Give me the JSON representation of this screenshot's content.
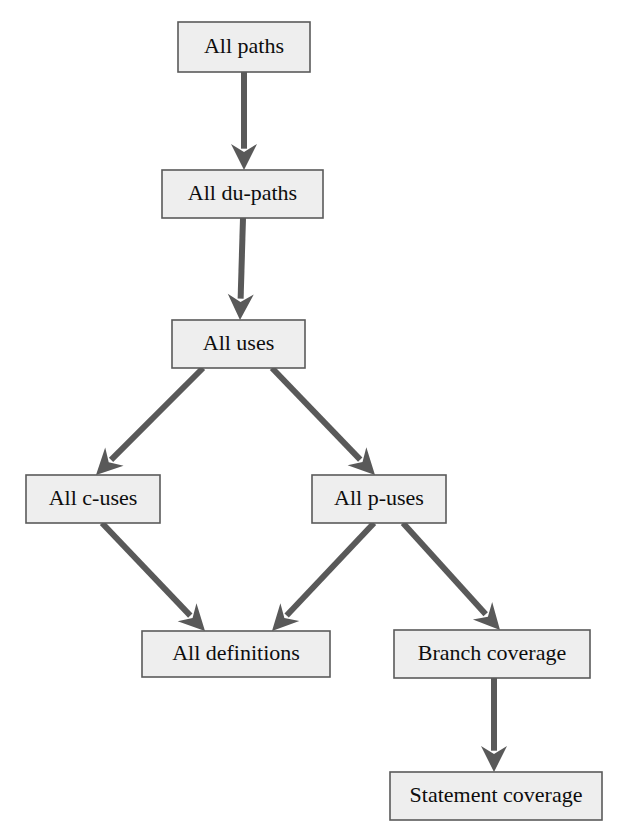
{
  "diagram": {
    "type": "flowchart",
    "direction": "top-to-bottom",
    "colors": {
      "box_fill": "#eeeeee",
      "box_border": "#5a5a5a",
      "arrow": "#595959",
      "text": "#0d0d0d",
      "background": "#ffffff"
    },
    "nodes": [
      {
        "id": "all-paths",
        "label": "All paths",
        "x": 178,
        "y": 22,
        "w": 132,
        "h": 50,
        "font_size": 22
      },
      {
        "id": "all-du-paths",
        "label": "All du-paths",
        "x": 162,
        "y": 170,
        "w": 161,
        "h": 48,
        "font_size": 22
      },
      {
        "id": "all-uses",
        "label": "All uses",
        "x": 172,
        "y": 320,
        "w": 133,
        "h": 48,
        "font_size": 22
      },
      {
        "id": "all-c-uses",
        "label": "All c-uses",
        "x": 26,
        "y": 475,
        "w": 134,
        "h": 48,
        "font_size": 22
      },
      {
        "id": "all-p-uses",
        "label": "All p-uses",
        "x": 312,
        "y": 475,
        "w": 134,
        "h": 48,
        "font_size": 22
      },
      {
        "id": "all-definitions",
        "label": "All definitions",
        "x": 142,
        "y": 631,
        "w": 188,
        "h": 46,
        "font_size": 22
      },
      {
        "id": "branch-coverage",
        "label": "Branch coverage",
        "x": 394,
        "y": 630,
        "w": 196,
        "h": 48,
        "font_size": 22
      },
      {
        "id": "statement-coverage",
        "label": "Statement coverage",
        "x": 390,
        "y": 772,
        "w": 212,
        "h": 48,
        "font_size": 22
      }
    ],
    "edges": [
      {
        "id": "e1",
        "from": "all-paths",
        "to": "all-du-paths",
        "x1": 244,
        "y1": 72,
        "x2": 244,
        "y2": 170
      },
      {
        "id": "e2",
        "from": "all-du-paths",
        "to": "all-uses",
        "x1": 243,
        "y1": 218,
        "x2": 240,
        "y2": 320
      },
      {
        "id": "e3",
        "from": "all-uses",
        "to": "all-c-uses",
        "x1": 203,
        "y1": 368,
        "x2": 96,
        "y2": 475
      },
      {
        "id": "e4",
        "from": "all-uses",
        "to": "all-p-uses",
        "x1": 272,
        "y1": 368,
        "x2": 375,
        "y2": 475
      },
      {
        "id": "e5",
        "from": "all-c-uses",
        "to": "all-definitions",
        "x1": 102,
        "y1": 523,
        "x2": 205,
        "y2": 631
      },
      {
        "id": "e6",
        "from": "all-p-uses",
        "to": "all-definitions",
        "x1": 374,
        "y1": 523,
        "x2": 272,
        "y2": 631
      },
      {
        "id": "e7",
        "from": "all-p-uses",
        "to": "branch-coverage",
        "x1": 403,
        "y1": 523,
        "x2": 500,
        "y2": 630
      },
      {
        "id": "e8",
        "from": "branch-coverage",
        "to": "statement-coverage",
        "x1": 494,
        "y1": 678,
        "x2": 494,
        "y2": 772
      }
    ]
  }
}
